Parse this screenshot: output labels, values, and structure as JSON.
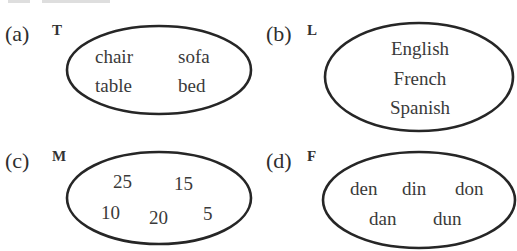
{
  "header_fragment": {
    "note": "partially cut-off line of text at top edge, unreadable"
  },
  "style": {
    "ink_color": "#2e2e2e",
    "ellipse_stroke": "#262626",
    "background": "#ffffff"
  },
  "sets": [
    {
      "part_label": "(a)",
      "set_name": "T",
      "members": [
        "chair",
        "sofa",
        "table",
        "bed"
      ]
    },
    {
      "part_label": "(b)",
      "set_name": "L",
      "members": [
        "English",
        "French",
        "Spanish"
      ]
    },
    {
      "part_label": "(c)",
      "set_name": "M",
      "members": [
        "25",
        "15",
        "10",
        "20",
        "5"
      ]
    },
    {
      "part_label": "(d)",
      "set_name": "F",
      "members": [
        "den",
        "din",
        "don",
        "dan",
        "dun"
      ]
    }
  ]
}
